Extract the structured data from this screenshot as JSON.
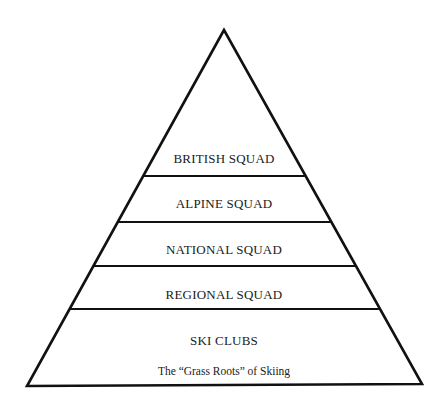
{
  "diagram": {
    "type": "pyramid",
    "colors": {
      "stroke": "#111111",
      "text": "#1a1a1a",
      "background": "#ffffff"
    },
    "tiers": [
      {
        "label": "BRITISH SQUAD"
      },
      {
        "label": "ALPINE SQUAD"
      },
      {
        "label": "NATIONAL SQUAD"
      },
      {
        "label": "REGIONAL SQUAD"
      },
      {
        "label": "SKI CLUBS",
        "sublabel": "The “Grass Roots” of Skiing"
      }
    ]
  }
}
